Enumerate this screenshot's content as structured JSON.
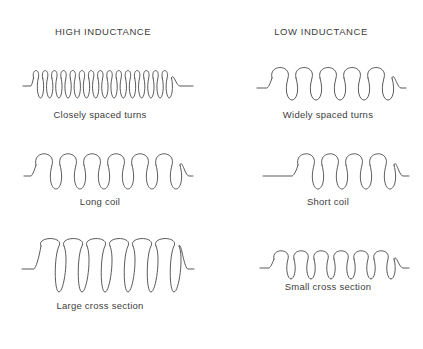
{
  "diagram": {
    "background_color": "#ffffff",
    "stroke_color": "#3c3c3c",
    "text_color": "#3d3d3d",
    "columns": [
      {
        "id": "high",
        "header": "HIGH INDUCTANCE"
      },
      {
        "id": "low",
        "header": "LOW INDUCTANCE"
      }
    ],
    "figures": [
      {
        "id": "closely-spaced-turns",
        "column": "high",
        "row": 1,
        "caption": "Closely spaced turns",
        "coil": {
          "turns": 26,
          "spacing": "close",
          "loop_width": 6.6,
          "loop_height": 22,
          "lead_left": 10,
          "lead_right": 14,
          "inductance": "high"
        }
      },
      {
        "id": "widely-spaced-turns",
        "column": "low",
        "row": 1,
        "caption": "Widely spaced turns",
        "coil": {
          "turns": 5,
          "spacing": "wide",
          "loop_width": 14,
          "loop_height": 24,
          "lead_left": 10,
          "lead_right": 12,
          "inductance": "low"
        }
      },
      {
        "id": "long-coil",
        "column": "high",
        "row": 2,
        "caption": "Long coil",
        "coil": {
          "turns": 9,
          "spacing": "medium",
          "loop_width": 14,
          "loop_height": 26,
          "lead_left": 8,
          "lead_right": 10,
          "inductance": "high"
        }
      },
      {
        "id": "short-coil",
        "column": "low",
        "row": 2,
        "caption": "Short coil",
        "coil": {
          "turns": 4,
          "spacing": "medium",
          "loop_width": 14,
          "loop_height": 26,
          "lead_left": 36,
          "lead_right": 32,
          "inductance": "low"
        }
      },
      {
        "id": "large-cross-section",
        "column": "high",
        "row": 3,
        "caption": "Large cross section",
        "coil": {
          "turns": 6,
          "spacing": "medium",
          "loop_width": 19,
          "loop_height": 46,
          "lead_left": 12,
          "lead_right": 22,
          "inductance": "high"
        }
      },
      {
        "id": "small-cross-section",
        "column": "low",
        "row": 3,
        "caption": "Small cross section",
        "coil": {
          "turns": 8,
          "spacing": "close",
          "loop_width": 12,
          "loop_height": 20,
          "lead_left": 10,
          "lead_right": 12,
          "inductance": "low"
        }
      }
    ]
  }
}
